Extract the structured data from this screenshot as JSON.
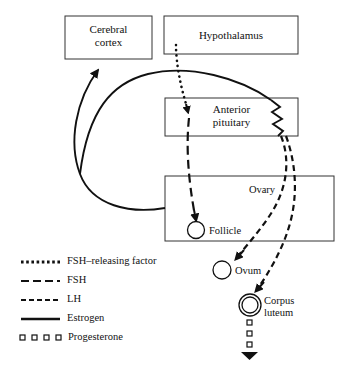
{
  "diagram": {
    "boxes": [
      {
        "id": "cerebral-cortex",
        "label_line1": "Cerebral",
        "label_line2": "cortex"
      },
      {
        "id": "hypothalamus",
        "label_line1": "Hypothalamus",
        "label_line2": ""
      },
      {
        "id": "anterior-pituitary",
        "label_line1": "Anterior",
        "label_line2": "pituitary"
      },
      {
        "id": "ovary",
        "label_line1": "Ovary",
        "label_line2": ""
      }
    ],
    "structures": [
      {
        "id": "follicle",
        "label": "Follicle"
      },
      {
        "id": "ovum",
        "label": "Ovum"
      },
      {
        "id": "corpus-luteum",
        "label_line1": "Corpus",
        "label_line2": "luteum"
      }
    ],
    "legend": {
      "items": [
        {
          "id": "fsh-releasing-factor",
          "label": "FSH–releasing factor",
          "style": "dotted"
        },
        {
          "id": "fsh",
          "label": "FSH",
          "style": "long-dash"
        },
        {
          "id": "lh",
          "label": "LH",
          "style": "short-dash"
        },
        {
          "id": "estrogen",
          "label": "Estrogen",
          "style": "solid"
        },
        {
          "id": "progesterone",
          "label": "Progesterone",
          "style": "squares"
        }
      ]
    },
    "colors": {
      "stroke": "#111111",
      "box_stroke": "#333333",
      "background": "#ffffff",
      "text": "#111111"
    }
  }
}
